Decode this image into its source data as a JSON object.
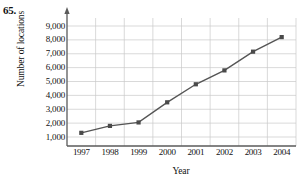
{
  "problem": {
    "number": "65."
  },
  "chart_data": {
    "type": "line",
    "title": "",
    "xlabel": "Year",
    "ylabel": "Number of locations",
    "categories": [
      "1997",
      "1998",
      "1999",
      "2000",
      "2001",
      "2002",
      "2003",
      "2004"
    ],
    "x": [
      1997,
      1998,
      1999,
      2000,
      2001,
      2002,
      2003,
      2004
    ],
    "values": [
      1300,
      1800,
      2050,
      3500,
      4800,
      5800,
      7150,
      8200
    ],
    "series": [
      {
        "name": "Number of locations",
        "values": [
          1300,
          1800,
          2050,
          3500,
          4800,
          5800,
          7150,
          8200
        ]
      }
    ],
    "ytick_labels": [
      "9,000",
      "8,000",
      "7,000",
      "6,000",
      "5,000",
      "4,000",
      "3,000",
      "2,000",
      "1,000"
    ],
    "yticks": [
      9000,
      8000,
      7000,
      6000,
      5000,
      4000,
      3000,
      2000,
      1000
    ],
    "ylim": [
      0,
      9500
    ],
    "xlim": [
      1996.4,
      2004.6
    ],
    "grid": true,
    "legend": false,
    "marker": "square",
    "line_color": "#555555",
    "marker_color": "#4a4a4a",
    "grid_color": "#c9c9c9",
    "axis_color": "#5a5a5a"
  }
}
